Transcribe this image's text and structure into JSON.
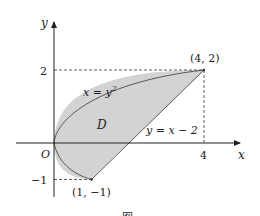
{
  "figure": {
    "type": "region-plot",
    "axes": {
      "x_label": "x",
      "y_label": "y",
      "origin_label": "O",
      "x_ticks": [
        {
          "value": 4,
          "label": "4"
        }
      ],
      "y_ticks": [
        {
          "value": 2,
          "label": "2"
        },
        {
          "value": -1,
          "label": "−1"
        }
      ]
    },
    "curves": [
      {
        "name": "parabola",
        "equation_label": "x = y",
        "superscript": "2"
      },
      {
        "name": "line",
        "equation_label": "y = x − 2"
      }
    ],
    "region": {
      "label": "D",
      "fill": "#d3d3d3",
      "stroke": "#555555"
    },
    "points": [
      {
        "name": "upper-intersection",
        "label": "(4, 2)",
        "x": 4,
        "y": 2
      },
      {
        "name": "lower-intersection",
        "label": "(1, −1)",
        "x": 1,
        "y": -1
      }
    ],
    "caption": "图"
  }
}
